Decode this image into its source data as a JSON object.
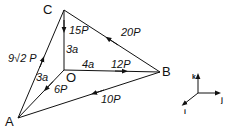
{
  "diagram": {
    "type": "force-system-tetrahedron",
    "points": {
      "A": "A",
      "B": "B",
      "C": "C",
      "O": "O"
    },
    "forces": [
      {
        "id": "CO",
        "label": "15P",
        "from": "C",
        "to": "O"
      },
      {
        "id": "BC",
        "label": "20P",
        "from": "B",
        "to": "C"
      },
      {
        "id": "AC",
        "label": "9√2 P",
        "from": "A",
        "to": "C"
      },
      {
        "id": "OB",
        "label": "12P",
        "from": "O",
        "to": "B"
      },
      {
        "id": "OA",
        "label": "6P",
        "from": "O",
        "to": "A"
      },
      {
        "id": "BA",
        "label": "10P",
        "from": "B",
        "to": "A"
      }
    ],
    "dimensions": {
      "OC": "3a",
      "OB": "4a",
      "OA": "3a"
    },
    "axes": {
      "k": "k",
      "j": "j",
      "i": "i"
    }
  }
}
